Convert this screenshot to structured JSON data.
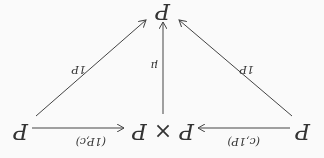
{
  "nodes": {
    "left": "P",
    "center": "P × P",
    "right": "P",
    "bottom": "P"
  },
  "labels": {
    "left_arrow": "(c,1P)",
    "right_arrow": "(1P,c)",
    "left_diag": "1P",
    "vertical": "μ",
    "right_diag": "1P"
  },
  "orientation": "rotated 180°"
}
